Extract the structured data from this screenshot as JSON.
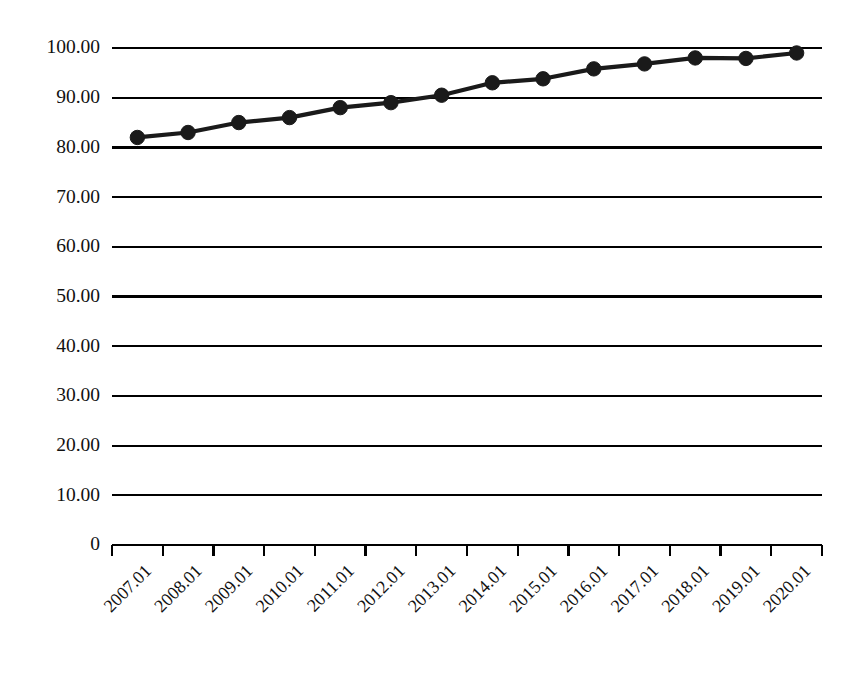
{
  "chart_data": {
    "type": "line",
    "title": "",
    "xlabel": "",
    "ylabel": "",
    "categories": [
      "2007.01",
      "2008.01",
      "2009.01",
      "2010.01",
      "2011.01",
      "2012.01",
      "2013.01",
      "2014.01",
      "2015.01",
      "2016.01",
      "2017.01",
      "2018.01",
      "2019.01",
      "2020.01"
    ],
    "values": [
      82,
      83,
      85,
      86,
      88,
      89,
      90.5,
      93,
      93.8,
      95.8,
      96.8,
      98,
      97.9,
      99
    ],
    "series": [
      {
        "name": "",
        "values": [
          82,
          83,
          85,
          86,
          88,
          89,
          90.5,
          93,
          93.8,
          95.8,
          96.8,
          98,
          97.9,
          99
        ]
      }
    ],
    "ylim": [
      0,
      100
    ],
    "ytick_labels": [
      "100.00",
      "90.00",
      "80.00",
      "70.00",
      "60.00",
      "50.00",
      "40.00",
      "30.00",
      "20.00",
      "10.00",
      "0"
    ],
    "ytick_values": [
      100,
      90,
      80,
      70,
      60,
      50,
      40,
      30,
      20,
      10,
      0
    ],
    "grid": true,
    "grid_axis": "y",
    "legend": false,
    "legend_position": "none",
    "marker": "circle",
    "marker_color": "#1a1a1a",
    "line_color": "#1a1a1a",
    "background_color": "#ffffff",
    "xtick_rotation": 45
  }
}
